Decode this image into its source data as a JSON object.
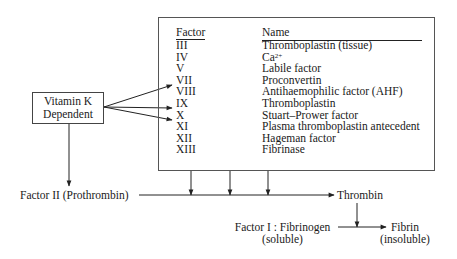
{
  "diagram": {
    "vitamin_k_box": {
      "line1": "Vitamin K",
      "line2": "Dependent"
    },
    "table": {
      "header_factor": "Factor",
      "header_name": "Name",
      "rows": [
        {
          "factor": "III",
          "name": "Thromboplastin (tissue)"
        },
        {
          "factor": "IV",
          "name": "Ca",
          "name_sup": "2+"
        },
        {
          "factor": "V",
          "name": "Labile factor"
        },
        {
          "factor": "VII",
          "name": "Proconvertin"
        },
        {
          "factor": "VIII",
          "name": "Antihaemophilic factor (AHF)"
        },
        {
          "factor": "IX",
          "name": "Thromboplastin"
        },
        {
          "factor": "X",
          "name": "Stuart–Prower factor"
        },
        {
          "factor": "XI",
          "name": "Plasma thromboplastin antecedent"
        },
        {
          "factor": "XII",
          "name": "Hageman factor"
        },
        {
          "factor": "XIII",
          "name": "Fibrinase"
        }
      ]
    },
    "vitamin_k_targets": [
      "VII",
      "IX",
      "X"
    ],
    "pathway": {
      "prothrombin": "Factor II (Prothrombin)",
      "thrombin": "Thrombin",
      "fibrinogen_line1": "Factor I : Fibrinogen",
      "fibrinogen_line2": "(soluble)",
      "fibrin_line1": "Fibrin",
      "fibrin_line2": "(insoluble)"
    },
    "colors": {
      "line": "#222222",
      "text": "#1a1a1a",
      "background": "#ffffff"
    }
  }
}
